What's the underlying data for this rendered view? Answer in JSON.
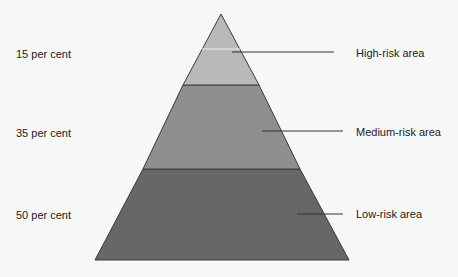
{
  "diagram": {
    "type": "pyramid",
    "levels": [
      {
        "id": "high",
        "percentage_label": "15 per cent",
        "area_label": "High-risk area",
        "color": "#b9b9b9"
      },
      {
        "id": "medium",
        "percentage_label": "35 per cent",
        "area_label": "Medium-risk area",
        "color": "#8f8f8f"
      },
      {
        "id": "low",
        "percentage_label": "50 per cent",
        "area_label": "Low-risk area",
        "color": "#676767"
      }
    ],
    "colors": {
      "background": "#f7f7f7",
      "outline": "#3a3a3a",
      "leader_line": "#333333",
      "highlight": "#f2f2f2"
    }
  }
}
